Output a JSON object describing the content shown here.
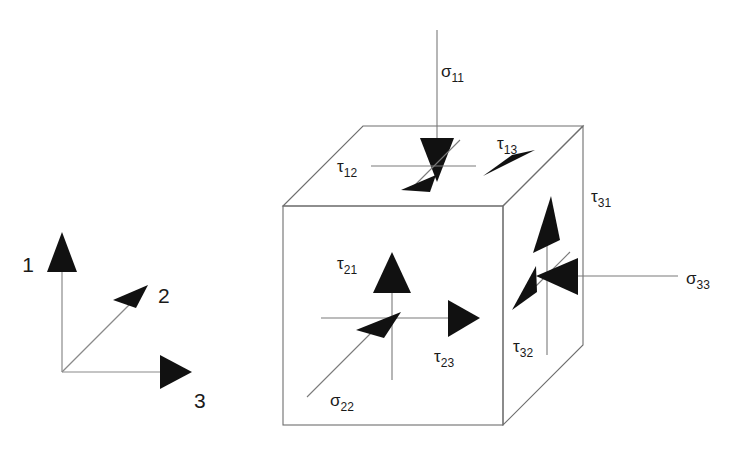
{
  "figure": {
    "background_color": "#ffffff",
    "line_color": "#6e6e6e",
    "arrow_color": "#111111",
    "text_color": "#1a1a1a"
  },
  "axes": {
    "name": "coordinate-triad",
    "origin": {
      "x": 62,
      "y": 372
    },
    "items": [
      {
        "id": "axis-1",
        "label": "1",
        "direction": "up",
        "tip": {
          "x": 62,
          "y": 248
        },
        "label_pos": {
          "x": 28,
          "y": 272
        }
      },
      {
        "id": "axis-2",
        "label": "2",
        "direction": "up-right-diag",
        "tip": {
          "x": 146,
          "y": 288
        },
        "label_pos": {
          "x": 156,
          "y": 303
        }
      },
      {
        "id": "axis-3",
        "label": "3",
        "direction": "right",
        "tip": {
          "x": 188,
          "y": 372
        },
        "label_pos": {
          "x": 192,
          "y": 407
        }
      }
    ]
  },
  "cube": {
    "name": "stress-element-cube",
    "front_face": {
      "left": 283,
      "top": 206,
      "right": 503,
      "bottom": 425
    },
    "depth_offset": {
      "dx": 80,
      "dy": -80
    },
    "faces": [
      "front",
      "top",
      "right"
    ]
  },
  "stresses": [
    {
      "id": "sigma-11",
      "symbol": "σ",
      "subscript": "11",
      "face": "top",
      "kind": "normal",
      "direction": "down",
      "label_pos": {
        "x": 441,
        "y": 77
      }
    },
    {
      "id": "tau-12",
      "symbol": "τ",
      "subscript": "12",
      "face": "top",
      "kind": "shear",
      "direction": "depth-down-left",
      "label_pos": {
        "x": 337,
        "y": 172
      }
    },
    {
      "id": "tau-13",
      "symbol": "τ",
      "subscript": "13",
      "face": "top",
      "kind": "shear",
      "direction": "right",
      "label_pos": {
        "x": 497,
        "y": 149
      }
    },
    {
      "id": "tau-21",
      "symbol": "τ",
      "subscript": "21",
      "face": "front",
      "kind": "shear",
      "direction": "up",
      "label_pos": {
        "x": 337,
        "y": 269
      }
    },
    {
      "id": "tau-23",
      "symbol": "τ",
      "subscript": "23",
      "face": "front",
      "kind": "shear",
      "direction": "right",
      "label_pos": {
        "x": 434,
        "y": 362
      }
    },
    {
      "id": "sigma-22",
      "symbol": "σ",
      "subscript": "22",
      "face": "front",
      "kind": "normal",
      "direction": "depth-up-right",
      "label_pos": {
        "x": 330,
        "y": 406
      }
    },
    {
      "id": "tau-31",
      "symbol": "τ",
      "subscript": "31",
      "face": "right",
      "kind": "shear",
      "direction": "up",
      "label_pos": {
        "x": 591,
        "y": 202
      }
    },
    {
      "id": "tau-32",
      "symbol": "τ",
      "subscript": "32",
      "face": "right",
      "kind": "shear",
      "direction": "depth-down-left",
      "label_pos": {
        "x": 513,
        "y": 352
      }
    },
    {
      "id": "sigma-33",
      "symbol": "σ",
      "subscript": "33",
      "face": "right",
      "kind": "normal",
      "direction": "left",
      "label_pos": {
        "x": 686,
        "y": 284
      }
    }
  ]
}
